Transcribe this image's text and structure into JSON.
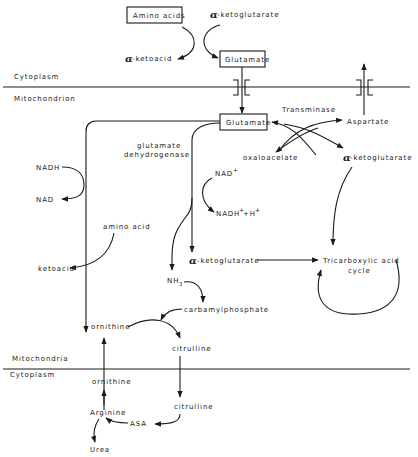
{
  "compartments": {
    "top_cytoplasm": "Cytoplasm",
    "mitochondrion": "Mitochondrion",
    "mitochondria": "Mitochondria",
    "bottom_cytoplasm": "Cytoplasm"
  },
  "nodes": {
    "amino_acids": "Amino acids",
    "alpha_ketoglutarate_top": "-ketoglutarate",
    "alpha_ketoacid": "-ketoacid",
    "glutamate_cyto": "Glutamate",
    "glutamate_mito": "Glutamate",
    "transminase": "Transminase",
    "aspartate": "Aspartate",
    "oxaloacelate": "oxaloacelate",
    "alpha_ketoglutarate_right": "-ketoglutarate",
    "nadh": "NADH",
    "nad": "NAD",
    "glutamate_dehydrogenase_1": "glutamate",
    "glutamate_dehydrogenase_2": "dehydrogenase",
    "nad_plus": "NAD",
    "nadh_h": "NADH",
    "plus_h": "+H",
    "amino_acid": "amino acid",
    "ketoacid": "ketoacid",
    "alpha_ketoglutarate_mid": "-ketoglutarate",
    "tca_1": "Tricarboxylic acid",
    "tca_2": "cycle",
    "nh3": "NH",
    "nh3_sub": "3",
    "carbamylphosphate": "carbamylphosphate",
    "ornithine_mito": "ornithine",
    "citrulline_mito": "citrulline",
    "ornithine_cyto": "ornithine",
    "citrulline_cyto": "citrulline",
    "arginine": "Arginine",
    "asa": "ASA",
    "urea": "Urea"
  },
  "symbols": {
    "alpha": "α",
    "plus": "+"
  },
  "colors": {
    "ink": "#1a1a1a",
    "background": "#ffffff"
  }
}
